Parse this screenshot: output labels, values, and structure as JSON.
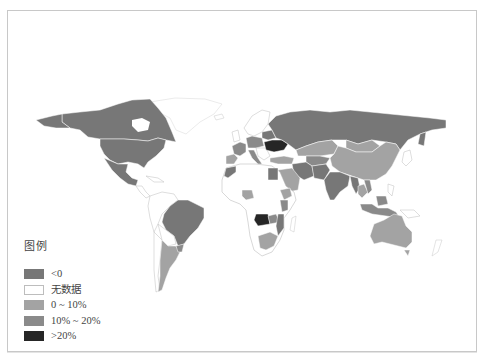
{
  "map": {
    "type": "choropleth",
    "region": "world",
    "border_color": "#c8c8c8"
  },
  "legend": {
    "title": "图例",
    "items": [
      {
        "label": "<0",
        "color": "#777777"
      },
      {
        "label": "无数据",
        "color": "#ffffff"
      },
      {
        "label": "0 ~ 10%",
        "color": "#a3a3a3"
      },
      {
        "label": "10% ~ 20%",
        "color": "#8a8a8a"
      },
      {
        "label": ">20%",
        "color": "#262626"
      }
    ]
  },
  "regions": {
    "lt0": [
      "Canada",
      "United States",
      "Mexico",
      "Brazil",
      "Russia",
      "India",
      "Iran",
      "Egypt",
      "Morocco",
      "Mozambique",
      "Myanmar",
      "Afghanistan",
      "Pakistan",
      "Zambia"
    ],
    "0_10": [
      "Argentina",
      "China",
      "Kazakhstan",
      "Australia",
      "South Africa",
      "Nigeria",
      "Ethiopia",
      "Turkey",
      "Saudi Arabia",
      "Mongolia",
      "Thailand"
    ],
    "10_20": [
      "France",
      "Germany",
      "Poland",
      "Italy",
      "Kenya",
      "Vietnam",
      "Indonesia"
    ],
    "gt20": [
      "Ukraine",
      "Angola"
    ],
    "no_data": [
      "Greenland",
      "Scandinavia",
      "most of Africa",
      "Central America",
      "most of South America",
      "Japan",
      "New Zealand"
    ]
  }
}
